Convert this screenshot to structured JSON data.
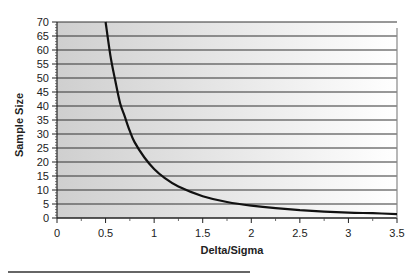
{
  "chart_data": {
    "type": "line",
    "title": "",
    "xlabel": "Delta/Sigma",
    "ylabel": "Sample Size",
    "xlim": [
      0,
      3.5
    ],
    "ylim": [
      0,
      70
    ],
    "x_ticks": [
      "0",
      "0.5",
      "1",
      "1.5",
      "2",
      "2.5",
      "3",
      "3.5"
    ],
    "y_ticks": [
      "0",
      "5",
      "10",
      "15",
      "20",
      "25",
      "30",
      "35",
      "40",
      "45",
      "50",
      "55",
      "60",
      "65",
      "70"
    ],
    "grid": "horizontal",
    "legend": "none",
    "series": [
      {
        "name": "Sample Size",
        "x": [
          0.5,
          0.55,
          0.6,
          0.65,
          0.7,
          0.75,
          0.8,
          0.9,
          1.0,
          1.1,
          1.25,
          1.5,
          1.75,
          2.0,
          2.25,
          2.5,
          2.75,
          3.0,
          3.25,
          3.5
        ],
        "values": [
          70,
          58,
          49,
          41,
          36,
          31,
          27,
          21.6,
          17.5,
          14.5,
          11.2,
          7.8,
          5.7,
          4.4,
          3.5,
          2.8,
          2.3,
          1.9,
          1.7,
          1.4
        ]
      }
    ]
  },
  "colors": {
    "curve": "#111111",
    "grid": "#333333",
    "plot_bg_left": "#cfcfcf",
    "plot_bg_right": "#ffffff"
  }
}
